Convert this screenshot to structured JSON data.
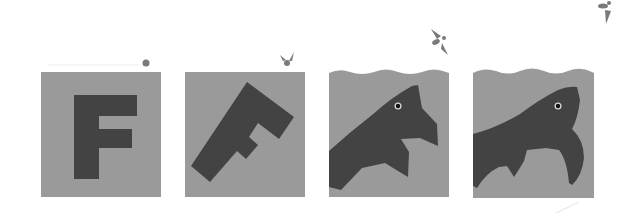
{
  "figure": {
    "colors": {
      "background": "#ffffff",
      "panel": "#9a9a9a",
      "shape": "#434343",
      "eye_ring": "#d8d8d8",
      "eye": "#111111",
      "creature": "#7a7a7a"
    },
    "panels": [
      {
        "index": 1,
        "label": "F upright",
        "state": "letter"
      },
      {
        "index": 2,
        "label": "F rotated",
        "state": "letter-tilted"
      },
      {
        "index": 3,
        "label": "F-fish with water surface",
        "state": "partial-fish"
      },
      {
        "index": 4,
        "label": "Fish with water surface",
        "state": "fish"
      }
    ],
    "flyer_stages": [
      {
        "index": 1,
        "shape": "dot"
      },
      {
        "index": 2,
        "shape": "bud-with-wings"
      },
      {
        "index": 3,
        "shape": "winged-creature"
      },
      {
        "index": 4,
        "shape": "winged-creature"
      }
    ]
  }
}
